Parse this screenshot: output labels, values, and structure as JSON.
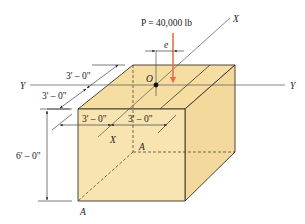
{
  "figure": {
    "load_label": "P = 40,000 lb",
    "eccentricity_label": "e",
    "origin_label": "O",
    "axes": {
      "x_top": "X",
      "x_bottom": "X",
      "y_left": "Y",
      "y_right": "Y"
    },
    "section_labels": {
      "a_back": "A",
      "a_front": "A"
    },
    "dimensions": {
      "depth_back": "3' – 0\"",
      "depth_front": "3' – 0\"",
      "width_left": "3' – 0\"",
      "width_right": "3' – 0\"",
      "height": "6' – 0\""
    },
    "colors": {
      "cube_fill": "#f8e4b0",
      "cube_top_fill": "#f6dea2",
      "cube_side_fill": "#f3d99c",
      "edge": "#3a3222",
      "load_arrow": "#e8704a",
      "axis_line": "#555555"
    }
  }
}
